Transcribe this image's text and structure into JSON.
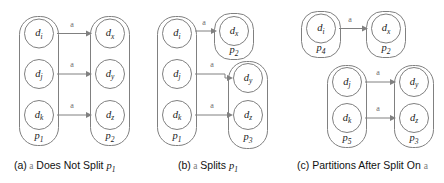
{
  "figure": {
    "colors": {
      "stroke": "#808080",
      "text": "#1a1a1a",
      "symbol": "#7a7a7a",
      "background": "#ffffff"
    },
    "edge_symbol": "a"
  },
  "panels": [
    {
      "id": "a",
      "caption_index": "(a)",
      "caption_symbol": "a",
      "caption_text": "Does Not Split",
      "caption_partition": "p",
      "caption_partition_sub": "1",
      "partitions": [
        {
          "name": "p",
          "sub": "1",
          "nodes": [
            {
              "base": "d",
              "sub": "i"
            },
            {
              "base": "d",
              "sub": "j"
            },
            {
              "base": "d",
              "sub": "k"
            }
          ]
        },
        {
          "name": "p",
          "sub": "2",
          "nodes": [
            {
              "base": "d",
              "sub": "x"
            },
            {
              "base": "d",
              "sub": "y"
            },
            {
              "base": "d",
              "sub": "z"
            }
          ]
        }
      ],
      "edges": [
        {
          "label": "a",
          "from": "d_i",
          "to": "d_x"
        },
        {
          "label": "a",
          "from": "d_j",
          "to": "d_y"
        },
        {
          "label": "a",
          "from": "d_k",
          "to": "d_z"
        }
      ]
    },
    {
      "id": "b",
      "caption_index": "(b)",
      "caption_symbol": "a",
      "caption_text": "Splits",
      "caption_partition": "p",
      "caption_partition_sub": "1",
      "partitions": [
        {
          "name": "p",
          "sub": "1",
          "nodes": [
            {
              "base": "d",
              "sub": "i"
            },
            {
              "base": "d",
              "sub": "j"
            },
            {
              "base": "d",
              "sub": "k"
            }
          ]
        },
        {
          "name": "p",
          "sub": "2",
          "nodes": [
            {
              "base": "d",
              "sub": "x"
            }
          ]
        },
        {
          "name": "p",
          "sub": "3",
          "nodes": [
            {
              "base": "d",
              "sub": "y"
            },
            {
              "base": "d",
              "sub": "z"
            }
          ]
        }
      ],
      "edges": [
        {
          "label": "a",
          "from": "d_i",
          "to": "d_x"
        },
        {
          "label": "a",
          "from": "d_j",
          "to": "d_y"
        },
        {
          "label": "a",
          "from": "d_k",
          "to": "d_z"
        }
      ]
    },
    {
      "id": "c",
      "caption_index": "(c)",
      "caption_symbol": "a",
      "caption_text": "Partitions After Split On",
      "caption_partition": "",
      "caption_partition_sub": "",
      "partitions": [
        {
          "name": "p",
          "sub": "4",
          "nodes": [
            {
              "base": "d",
              "sub": "i"
            }
          ]
        },
        {
          "name": "p",
          "sub": "2",
          "nodes": [
            {
              "base": "d",
              "sub": "x"
            }
          ]
        },
        {
          "name": "p",
          "sub": "5",
          "nodes": [
            {
              "base": "d",
              "sub": "j"
            },
            {
              "base": "d",
              "sub": "k"
            }
          ]
        },
        {
          "name": "p",
          "sub": "3",
          "nodes": [
            {
              "base": "d",
              "sub": "y"
            },
            {
              "base": "d",
              "sub": "z"
            }
          ]
        }
      ],
      "edges": [
        {
          "label": "a",
          "from": "d_i",
          "to": "d_x"
        },
        {
          "label": "a",
          "from": "d_j",
          "to": "d_y"
        },
        {
          "label": "a",
          "from": "d_k",
          "to": "d_z"
        }
      ]
    }
  ],
  "captions": {
    "a": {
      "index": "(a)",
      "sym": "a",
      "mid": " Does Not Split ",
      "p": "p",
      "psub": "1"
    },
    "b": {
      "index": "(b)",
      "sym": "a",
      "mid": " Splits ",
      "p": "p",
      "psub": "1"
    },
    "c": {
      "index": "(c)",
      "mid": " Partitions After Split On ",
      "sym": "a"
    }
  }
}
